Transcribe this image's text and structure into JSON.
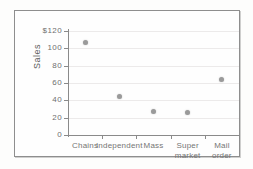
{
  "chart_data": {
    "type": "scatter",
    "title": "",
    "xlabel": "",
    "ylabel": "Sales",
    "categories": [
      "Chains",
      "Independent",
      "Mass",
      "Super\nmarket",
      "Mail\norder"
    ],
    "values": [
      107,
      45,
      27,
      26,
      64
    ],
    "ylim": [
      0,
      120
    ],
    "ytick_values": [
      0,
      20,
      40,
      60,
      80,
      100,
      120
    ],
    "ytick_labels": [
      "0",
      "20",
      "40",
      "60",
      "80",
      "100",
      "$120"
    ],
    "grid": true,
    "legend": null,
    "marker_color": "#9a9a9a",
    "axis_color": "#8a8a8a",
    "grid_color": "#eceaea"
  }
}
